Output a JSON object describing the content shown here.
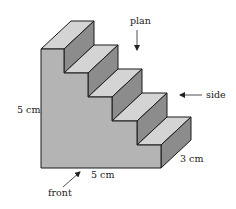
{
  "figure": {
    "type": "isometric-staircase-solid",
    "steps": 5,
    "colors": {
      "front_face": "#b4b4b4",
      "tread_top": "#d4d4d4",
      "riser_side": "#8c8c8c",
      "outline": "#1a1a1a",
      "text": "#222222"
    }
  },
  "labels": {
    "height": "5 cm",
    "width": "5 cm",
    "depth": "3 cm",
    "plan": "plan",
    "side": "side",
    "front": "front"
  },
  "views": [
    {
      "name": "plan",
      "direction": "from above"
    },
    {
      "name": "side",
      "direction": "from right"
    },
    {
      "name": "front",
      "direction": "from front-left"
    }
  ]
}
